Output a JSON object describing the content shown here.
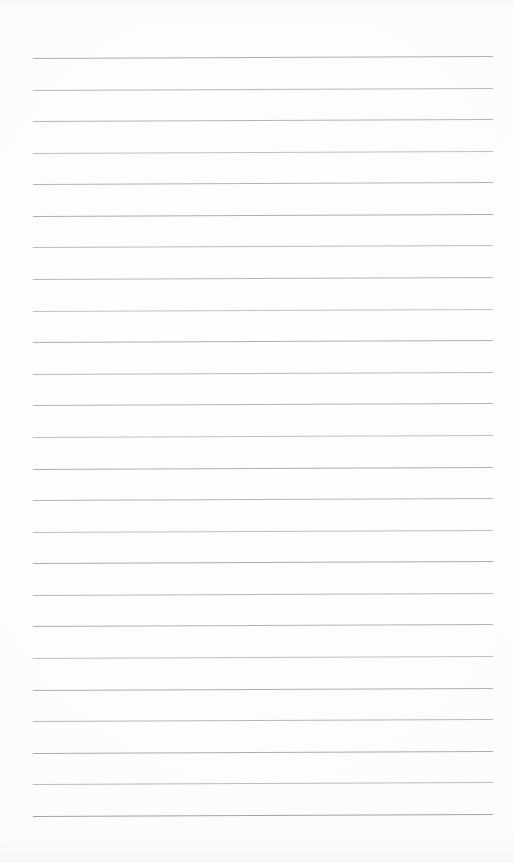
{
  "document": {
    "kind": "scanned-paper-scan",
    "title": "Blank Ruled Notepad Page",
    "page_width": 513,
    "page_height": 862,
    "paper_color": "#fefefe",
    "has_text_content": false,
    "has_handwriting": false,
    "margin_rule": null,
    "header_text": "",
    "footer_text": "",
    "page_number_text": ""
  },
  "ruling": {
    "line_color": "#b6b6bb",
    "line_color_light": "#c9c9ce",
    "line_color_dark": "#9ea0a6",
    "line_count": 25,
    "line_thickness_px": 1,
    "line_start_x": 33,
    "line_end_x": 493,
    "line_length_px": 460,
    "first_line_y": 58,
    "line_spacing_px": 31.6,
    "skew_rise_px": 2.0,
    "top_margin_px": 58,
    "bottom_margin_px": 45,
    "left_margin_px": 33,
    "right_margin_px": 20,
    "lines": [
      {
        "index": 1,
        "y": 58.0,
        "shade": "#a9abb1",
        "opacity": 0.95
      },
      {
        "index": 2,
        "y": 89.5,
        "shade": "#b0b2b7",
        "opacity": 0.92
      },
      {
        "index": 3,
        "y": 121.0,
        "shade": "#adafb5",
        "opacity": 0.94
      },
      {
        "index": 4,
        "y": 152.6,
        "shade": "#b4b6bb",
        "opacity": 0.88
      },
      {
        "index": 5,
        "y": 184.2,
        "shade": "#abadb3",
        "opacity": 0.93
      },
      {
        "index": 6,
        "y": 215.8,
        "shade": "#a8aab0",
        "opacity": 0.96
      },
      {
        "index": 7,
        "y": 247.4,
        "shade": "#b2b4b9",
        "opacity": 0.9
      },
      {
        "index": 8,
        "y": 279.0,
        "shade": "#aeb0b6",
        "opacity": 0.93
      },
      {
        "index": 9,
        "y": 310.5,
        "shade": "#b6b8bd",
        "opacity": 0.86
      },
      {
        "index": 10,
        "y": 342.1,
        "shade": "#a9abb1",
        "opacity": 0.95
      },
      {
        "index": 11,
        "y": 373.7,
        "shade": "#b1b3b8",
        "opacity": 0.91
      },
      {
        "index": 12,
        "y": 405.3,
        "shade": "#acaeb4",
        "opacity": 0.94
      },
      {
        "index": 13,
        "y": 436.9,
        "shade": "#b5b7bc",
        "opacity": 0.87
      },
      {
        "index": 14,
        "y": 468.5,
        "shade": "#aaacb2",
        "opacity": 0.95
      },
      {
        "index": 15,
        "y": 500.0,
        "shade": "#aeb0b6",
        "opacity": 0.92
      },
      {
        "index": 16,
        "y": 531.6,
        "shade": "#b3b5ba",
        "opacity": 0.89
      },
      {
        "index": 17,
        "y": 563.2,
        "shade": "#a7a9af",
        "opacity": 0.96
      },
      {
        "index": 18,
        "y": 594.8,
        "shade": "#b0b2b7",
        "opacity": 0.92
      },
      {
        "index": 19,
        "y": 626.4,
        "shade": "#abadb3",
        "opacity": 0.94
      },
      {
        "index": 20,
        "y": 658.0,
        "shade": "#b4b6bb",
        "opacity": 0.88
      },
      {
        "index": 21,
        "y": 689.5,
        "shade": "#a9abb1",
        "opacity": 0.95
      },
      {
        "index": 22,
        "y": 721.1,
        "shade": "#aeb0b6",
        "opacity": 0.93
      },
      {
        "index": 23,
        "y": 752.7,
        "shade": "#a6a8ae",
        "opacity": 0.97
      },
      {
        "index": 24,
        "y": 784.3,
        "shade": "#b1b3b8",
        "opacity": 0.91
      },
      {
        "index": 25,
        "y": 815.9,
        "shade": "#9ea0a6",
        "opacity": 0.98
      }
    ]
  }
}
